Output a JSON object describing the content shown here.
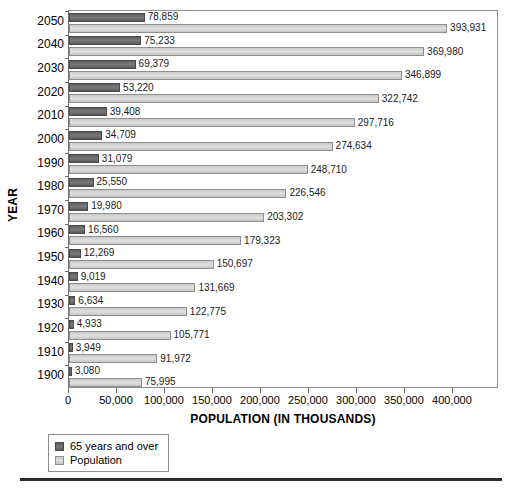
{
  "chart_data": {
    "type": "bar",
    "orientation": "horizontal",
    "title": "",
    "xlabel": "POPULATION (IN THOUSANDS)",
    "ylabel": "YEAR",
    "xlim": [
      0,
      448000
    ],
    "xticks": [
      0,
      50000,
      100000,
      150000,
      200000,
      250000,
      300000,
      350000,
      400000
    ],
    "xticklabels": [
      "0",
      "50,000",
      "100,000",
      "150,000",
      "200,000",
      "250,000",
      "300,000",
      "350,000",
      "400,000"
    ],
    "grid": false,
    "legend_position": "below-left",
    "categories": [
      "2050",
      "2040",
      "2030",
      "2020",
      "2010",
      "2000",
      "1990",
      "1980",
      "1970",
      "1960",
      "1950",
      "1940",
      "1930",
      "1920",
      "1910",
      "1900"
    ],
    "series": [
      {
        "name": "65 years and over",
        "color": "#6e6e6e",
        "values": [
          78859,
          75233,
          69379,
          53220,
          39408,
          34709,
          31079,
          25550,
          19980,
          16560,
          12269,
          9019,
          6634,
          4933,
          3949,
          3080
        ],
        "labels": [
          "78,859",
          "75,233",
          "69,379",
          "53,220",
          "39,408",
          "34,709",
          "31,079",
          "25,550",
          "19,980",
          "16,560",
          "12,269",
          "9,019",
          "6,634",
          "4,933",
          "3,949",
          "3,080"
        ]
      },
      {
        "name": "Population",
        "color": "#d6d6d6",
        "values": [
          393931,
          369980,
          346899,
          322742,
          297716,
          274634,
          248710,
          226546,
          203302,
          179323,
          150697,
          131669,
          122775,
          105771,
          91972,
          75995
        ],
        "labels": [
          "393,931",
          "369,980",
          "346,899",
          "322,742",
          "297,716",
          "274,634",
          "248,710",
          "226,546",
          "203,302",
          "179,323",
          "150,697",
          "131,669",
          "122,775",
          "105,771",
          "91,972",
          "75,995"
        ]
      }
    ]
  },
  "legend": {
    "items": [
      {
        "label": "65 years and over",
        "swatch": "dark"
      },
      {
        "label": "Population",
        "swatch": "light"
      }
    ]
  },
  "axes": {
    "x_title": "POPULATION (IN THOUSANDS)",
    "y_title": "YEAR"
  }
}
